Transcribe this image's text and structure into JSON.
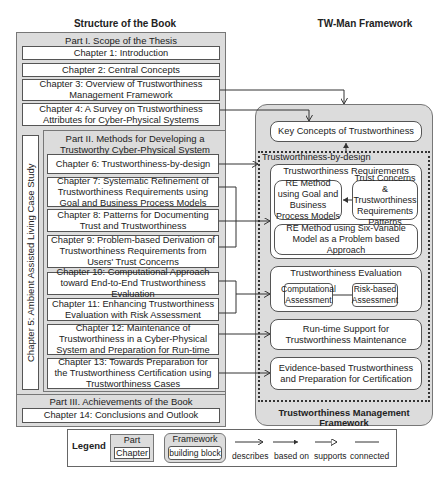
{
  "left_title": "Structure of the Book",
  "right_title": "TW-Man Framework",
  "parts": [
    {
      "label": "Part I. Scope of the Thesis",
      "chapters": [
        "Chapter 1: Introduction",
        "Chapter 2: Central Concepts",
        "Chapter 3: Overview of Trustworthiness Management Framework",
        "Chapter 4: A Survey on Trustworthiness Attributes for Cyber-Physical Systems"
      ]
    },
    {
      "label": "Part II. Methods for Developing a Trustworthy Cyber-Physical System",
      "chapters": [
        "Chapter 6: Trustworthiness-by-design",
        "Chapter 7: Systematic Refinement of Trustworthiness Requirements using Goal and Business Process Models",
        "Chapter 8: Patterns for Documenting Trust and Trustworthiness",
        "Chapter 9: Problem-based Derivation of Trustworthiness Requirements from Users' Trust Concerns",
        "Chapter 10: Computational Approach toward End-to-End Trustworthiness Evaluation",
        "Chapter 11: Enhancing Trustworthiness Evaluation with Risk Assessment",
        "Chapter 12: Maintenance of Trustworthiness in a Cyber-Physical System and Preparation for Run-time",
        "Chapter 13: Towards Preparation for the Trustworthiness Certification using Trustworthiness Cases"
      ]
    },
    {
      "label": "Part III. Achievements of the Book",
      "chapters": [
        "Chapter 14: Conclusions and Outlook"
      ]
    }
  ],
  "case_study": "Chapter 5: Ambient Assisted Living Case Study",
  "framework": {
    "name": "Trustworthiness Management Framework",
    "key_concepts": "Key Concepts of Trustworthiness",
    "by_design": "Trustworthiness-by-design",
    "requirements": {
      "label": "Trustworthiness Requirements",
      "re_goal": "RE Method using Goal and Business Process Models",
      "patterns": "Trust Concerns & Trustworthiness Requirements Patterns",
      "six_var": "RE Method using Six-Variable Model as a Problem based Approach"
    },
    "evaluation": {
      "label": "Trustworthiness Evaluation",
      "computational": "Computational Assessment",
      "risk": "Risk-based Assessment"
    },
    "runtime": "Run-time Support for Trustworthiness Maintenance",
    "evidence": "Evidence-based Trustworthiness and Preparation for Certification"
  },
  "legend": {
    "title": "Legend",
    "part": "Part",
    "chapter": "Chapter",
    "framework": "Framework",
    "building_block": "building block",
    "describes": "describes",
    "based_on": "based on",
    "supports": "supports",
    "connected": "connected"
  }
}
